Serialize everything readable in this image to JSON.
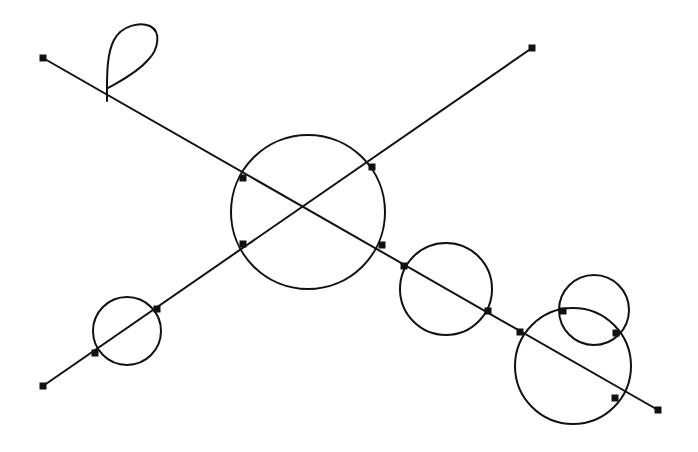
{
  "diagram": {
    "width": 698,
    "height": 452,
    "background": "#ffffff",
    "stroke_color": "#111111",
    "stroke_width": 2,
    "lines": [
      {
        "id": "line-a",
        "x1": 43,
        "y1": 58,
        "x2": 658,
        "y2": 410
      },
      {
        "id": "line-b",
        "x1": 43,
        "y1": 386,
        "x2": 532,
        "y2": 48
      }
    ],
    "circles": [
      {
        "id": "circle-center",
        "cx": 308,
        "cy": 212,
        "r": 77
      },
      {
        "id": "circle-right-middle",
        "cx": 446,
        "cy": 289,
        "r": 46
      },
      {
        "id": "circle-right-large",
        "cx": 573,
        "cy": 366,
        "r": 58
      },
      {
        "id": "circle-right-small",
        "cx": 594,
        "cy": 310,
        "r": 35
      },
      {
        "id": "circle-left-small",
        "cx": 127,
        "cy": 331,
        "r": 34
      }
    ],
    "loop": {
      "id": "loop-top-left",
      "path": "M107 101 C107 80, 106 55, 114 40 C122 25, 140 22, 150 26 C162 32, 158 50, 148 60 C136 74, 118 82, 108 88"
    },
    "markers": [
      {
        "x": 43,
        "y": 58
      },
      {
        "x": 532,
        "y": 48
      },
      {
        "x": 43,
        "y": 386
      },
      {
        "x": 658,
        "y": 410
      },
      {
        "x": 243,
        "y": 178
      },
      {
        "x": 372,
        "y": 167
      },
      {
        "x": 243,
        "y": 244
      },
      {
        "x": 382,
        "y": 245
      },
      {
        "x": 404,
        "y": 266
      },
      {
        "x": 488,
        "y": 311
      },
      {
        "x": 520,
        "y": 332
      },
      {
        "x": 563,
        "y": 311
      },
      {
        "x": 616,
        "y": 333
      },
      {
        "x": 615,
        "y": 398
      },
      {
        "x": 95,
        "y": 353
      },
      {
        "x": 157,
        "y": 309
      }
    ],
    "marker_size": 7
  }
}
